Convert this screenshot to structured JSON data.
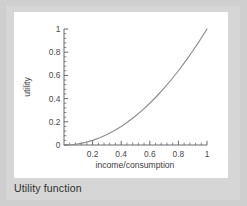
{
  "figure": {
    "caption": "Utility function",
    "background_color": "#d6d6d6",
    "panel_color": "#ffffff"
  },
  "chart_data": {
    "type": "line",
    "title": "",
    "xlabel": "income/consumption",
    "ylabel": "utility",
    "xlim": [
      0,
      1
    ],
    "ylim": [
      0,
      1
    ],
    "grid": false,
    "legend": false,
    "line_color": "#8c8c8c",
    "axis_color": "#5a5a5a",
    "x_ticks": [
      0.2,
      0.4,
      0.6,
      0.8,
      1
    ],
    "x_tick_labels": [
      "0.2",
      "0.4",
      "0.6",
      "0.8",
      "1"
    ],
    "y_ticks": [
      0,
      0.2,
      0.4,
      0.6,
      0.8,
      1
    ],
    "y_tick_labels": [
      "0",
      "0.2",
      "0.4",
      "0.6",
      "0.8",
      "1"
    ],
    "x_minor_ticks_per_major": 5,
    "y_minor_ticks_per_major": 5,
    "series": [
      {
        "name": "utility",
        "function": "y = x^2",
        "x": [
          0,
          0.05,
          0.1,
          0.15,
          0.2,
          0.25,
          0.3,
          0.35,
          0.4,
          0.45,
          0.5,
          0.55,
          0.6,
          0.65,
          0.7,
          0.75,
          0.8,
          0.85,
          0.9,
          0.95,
          1
        ],
        "values": [
          0,
          0.0025,
          0.01,
          0.0225,
          0.04,
          0.0625,
          0.09,
          0.1225,
          0.16,
          0.2025,
          0.25,
          0.3025,
          0.36,
          0.4225,
          0.49,
          0.5625,
          0.64,
          0.7225,
          0.81,
          0.9025,
          1
        ]
      }
    ]
  }
}
